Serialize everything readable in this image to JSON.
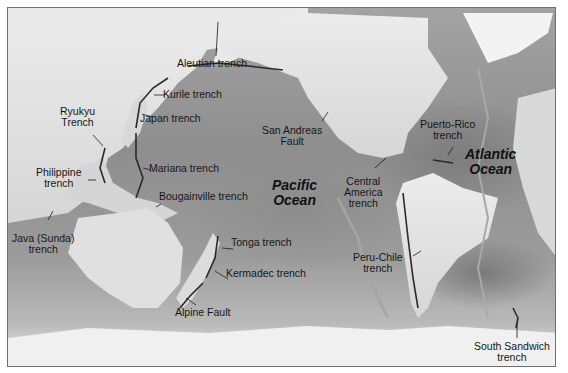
{
  "map": {
    "title": "Major ocean trenches and transform faults",
    "colors": {
      "deep_ocean": "#8e8e8e",
      "land": "#e4e4e4",
      "ice": "#f4f4f4",
      "border": "#6f6f6f",
      "label_text": "#161616"
    },
    "oceans": [
      {
        "id": "pacific",
        "line1": "Pacific",
        "line2": "Ocean"
      },
      {
        "id": "atlantic",
        "line1": "Atlantic",
        "line2": "Ocean"
      }
    ],
    "features": [
      {
        "id": "aleutian",
        "lines": [
          "Aleutian trench"
        ]
      },
      {
        "id": "kurile",
        "lines": [
          "Kurile trench"
        ]
      },
      {
        "id": "japan",
        "lines": [
          "Japan trench"
        ]
      },
      {
        "id": "ryukyu",
        "lines": [
          "Ryukyu",
          "Trench"
        ]
      },
      {
        "id": "philippine",
        "lines": [
          "Philippine",
          "trench"
        ]
      },
      {
        "id": "mariana",
        "lines": [
          "Mariana trench"
        ]
      },
      {
        "id": "bougainville",
        "lines": [
          "Bougainville trench"
        ]
      },
      {
        "id": "java",
        "lines": [
          "Java (Sunda)",
          "trench"
        ]
      },
      {
        "id": "tonga",
        "lines": [
          "Tonga trench"
        ]
      },
      {
        "id": "kermadec",
        "lines": [
          "Kermadec trench"
        ]
      },
      {
        "id": "alpine",
        "lines": [
          "Alpine Fault"
        ]
      },
      {
        "id": "san_andreas",
        "lines": [
          "San Andreas",
          "Fault"
        ]
      },
      {
        "id": "central_america",
        "lines": [
          "Central",
          "America",
          "trench"
        ]
      },
      {
        "id": "puerto_rico",
        "lines": [
          "Puerto-Rico",
          "trench"
        ]
      },
      {
        "id": "peru_chile",
        "lines": [
          "Peru-Chile",
          "trench"
        ]
      },
      {
        "id": "south_sandwich",
        "lines": [
          "South Sandwich",
          "trench"
        ]
      }
    ]
  }
}
